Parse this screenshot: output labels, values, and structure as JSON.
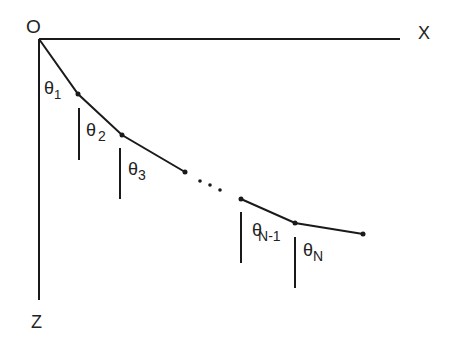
{
  "diagram": {
    "axes": {
      "origin_label": "O",
      "x_label": "X",
      "z_label": "Z"
    },
    "angles": [
      {
        "symbol": "θ",
        "subscript": "1"
      },
      {
        "symbol": "θ",
        "subscript": "2"
      },
      {
        "symbol": "θ",
        "subscript": "3"
      },
      {
        "symbol": "θ",
        "subscript": "N-1"
      },
      {
        "symbol": "θ",
        "subscript": "N"
      }
    ],
    "ellipsis": "· · ·",
    "colors": {
      "line": "#1a1a1a",
      "text": "#222222",
      "background": "#ffffff"
    }
  }
}
